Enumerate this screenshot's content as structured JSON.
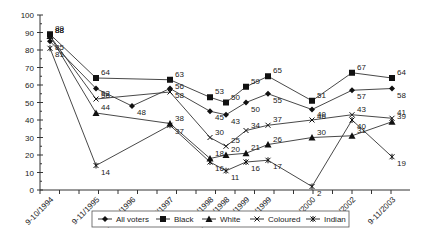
{
  "chart_data": {
    "type": "line",
    "title": "",
    "xlabel": "",
    "ylabel": "",
    "ylim": [
      0,
      100
    ],
    "yticks": [
      0,
      10,
      20,
      30,
      40,
      50,
      60,
      70,
      80,
      90,
      100
    ],
    "grid": false,
    "legend_position": "bottom",
    "categories": [
      "9-10/1994",
      "9-11/1995",
      "10-11/1996",
      "6-7/1997",
      "9/1998",
      "10-11/1998",
      "2-3/1999",
      "4/1999",
      "7-8/2000",
      "9-10/2002",
      "9-11/2003"
    ],
    "series": [
      {
        "name": "All voters",
        "marker": "diamond",
        "values": [
          85,
          58,
          48,
          58,
          45,
          43,
          50,
          55,
          46,
          57,
          58
        ]
      },
      {
        "name": "Black",
        "marker": "square",
        "values": [
          89,
          64,
          null,
          63,
          53,
          50,
          59,
          65,
          51,
          67,
          64
        ]
      },
      {
        "name": "White",
        "marker": "triangle",
        "values": [
          88,
          44,
          null,
          38,
          18,
          20,
          21,
          26,
          30,
          31,
          39
        ]
      },
      {
        "name": "Coloured",
        "marker": "x",
        "values": [
          88,
          52,
          null,
          56,
          30,
          25,
          34,
          37,
          40,
          43,
          41
        ]
      },
      {
        "name": "Indian",
        "marker": "asterisk",
        "values": [
          81,
          14,
          null,
          37,
          16,
          11,
          16,
          17,
          2,
          40,
          19
        ]
      }
    ]
  },
  "legend": {
    "items": [
      "All voters",
      "Black",
      "White",
      "Coloured",
      "Indian"
    ]
  }
}
